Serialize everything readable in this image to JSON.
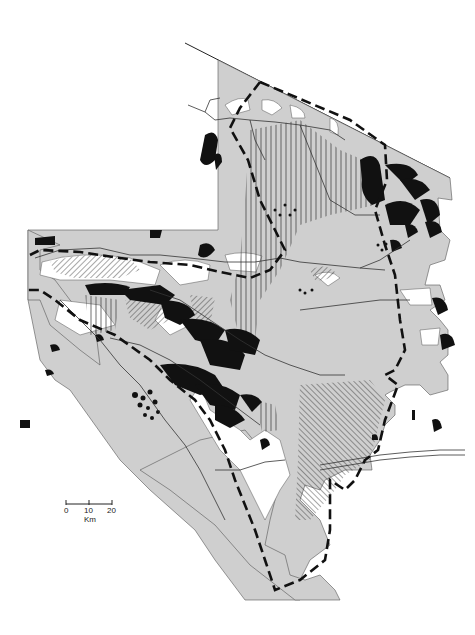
{
  "map": {
    "type": "thematic-monochrome",
    "colors": {
      "background": "#ffffff",
      "region_fill": "#cfcfcf",
      "dark_patch": "#111111",
      "boundary": "#111111",
      "river": "#333333"
    },
    "legend_symbols": [
      "gray-area",
      "black-patches",
      "diagonal-hatch",
      "vertical-hatch",
      "dashed-boundary",
      "river-lines"
    ],
    "scale_bar": {
      "ticks": [
        "0",
        "10",
        "20"
      ],
      "unit": "Km"
    }
  }
}
